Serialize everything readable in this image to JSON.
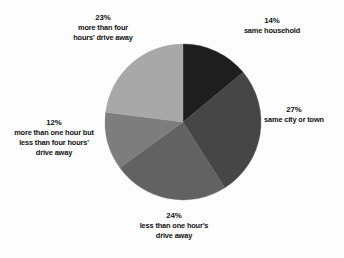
{
  "chart_data": {
    "type": "pie",
    "title": "",
    "subtitle": "",
    "xlabel": "",
    "ylabel": "",
    "legend_position": "none",
    "grid": false,
    "start_angle_deg": 0,
    "direction": "clockwise",
    "units": "percent",
    "categories": [
      "same household",
      "same city or town",
      "less than one hour's drive away",
      "more than one hour but less than four hours' drive away",
      "more than four hours' drive away"
    ],
    "values": [
      14,
      27,
      24,
      12,
      23
    ],
    "colors": [
      "#1e1e1e",
      "#464646",
      "#626262",
      "#7d7d7d",
      "#a8a8a8"
    ],
    "slices": [
      {
        "percent_label": "14%",
        "label_lines": [
          "same household"
        ],
        "value": 14,
        "color": "#1e1e1e",
        "start_deg": 0,
        "end_deg": 50.4
      },
      {
        "percent_label": "27%",
        "label_lines": [
          "same city or town"
        ],
        "value": 27,
        "color": "#464646",
        "start_deg": 50.4,
        "end_deg": 147.6
      },
      {
        "percent_label": "24%",
        "label_lines": [
          "less than one hour's",
          "drive away"
        ],
        "value": 24,
        "color": "#626262",
        "start_deg": 147.6,
        "end_deg": 234.0
      },
      {
        "percent_label": "12%",
        "label_lines": [
          "more than one hour but",
          "less than four hours'",
          "drive away"
        ],
        "value": 12,
        "color": "#7d7d7d",
        "start_deg": 234.0,
        "end_deg": 277.2
      },
      {
        "percent_label": "23%",
        "label_lines": [
          "more than four",
          "hours' drive away"
        ],
        "value": 23,
        "color": "#a8a8a8",
        "start_deg": 277.2,
        "end_deg": 360.0
      }
    ]
  },
  "labels": {
    "same_household": {
      "percent": "14%",
      "line1": "same household"
    },
    "same_city": {
      "percent": "27%",
      "line1": "same city or town"
    },
    "less_one_hour": {
      "percent": "24%",
      "line1": "less than one hour's",
      "line2": "drive away"
    },
    "one_to_four_hours": {
      "percent": "12%",
      "line1": "more than one hour but",
      "line2": "less than four hours'",
      "line3": "drive away"
    },
    "more_four_hours": {
      "percent": "23%",
      "line1": "more than four",
      "line2": "hours' drive away"
    }
  },
  "geometry": {
    "center_x": 183,
    "center_y": 122,
    "radius": 78
  },
  "background_color": "#fdfdfd"
}
